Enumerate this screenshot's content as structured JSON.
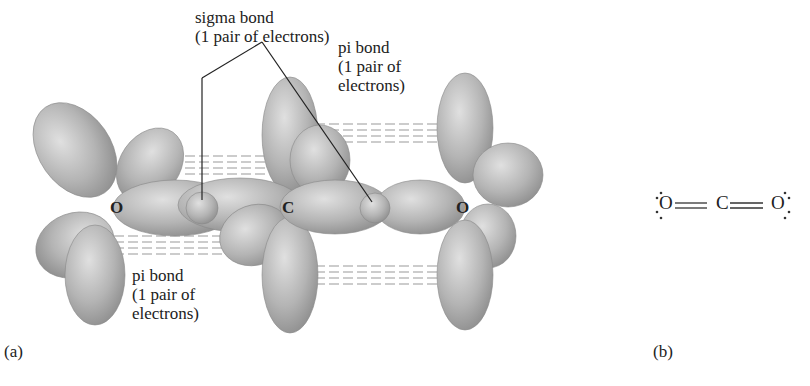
{
  "figure": {
    "panel_a": {
      "label": "(a)",
      "atoms": [
        "O",
        "C",
        "O"
      ],
      "annotations": {
        "sigma": {
          "line1": "sigma bond",
          "line2": "(1 pair of electrons)"
        },
        "pi_top": {
          "line1": "pi bond",
          "line2": "(1 pair of",
          "line3": "electrons)"
        },
        "pi_bottom": {
          "line1": "pi bond",
          "line2": "(1 pair of",
          "line3": "electrons)"
        }
      }
    },
    "panel_b": {
      "label": "(b)",
      "lewis_structure": {
        "left": "O",
        "center": "C",
        "right": "O",
        "bond": "══"
      }
    },
    "colors": {
      "lobe": "#a9a9a9",
      "lobe_light": "#d8d8d8",
      "text": "#222222"
    }
  }
}
